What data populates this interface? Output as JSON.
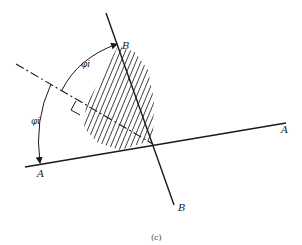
{
  "figure": {
    "caption": "(c)",
    "labels": {
      "line_a_left": "A",
      "line_a_right": "A",
      "line_b_top": "B",
      "line_b_bottom": "B",
      "angle_upper": "φi",
      "angle_lower": "φi"
    },
    "colors": {
      "ink": "#1a1a1a",
      "hatch": "#2a2a2a",
      "background": "#ffffff"
    }
  }
}
